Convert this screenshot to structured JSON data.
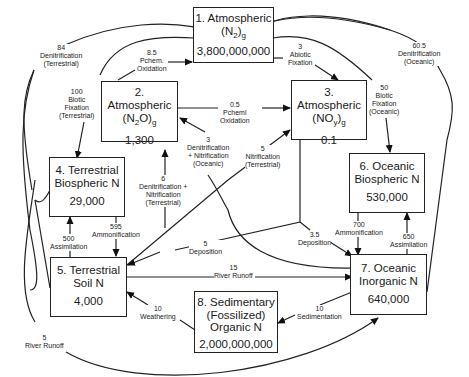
{
  "boxes": [
    {
      "id": 1,
      "line1": "1. Atmospheric",
      "line2_pre": "(N",
      "line2_sub": "2",
      "line2_post": ")",
      "line2_sub2": "g",
      "value": "3,800,000,000"
    },
    {
      "id": 2,
      "line1": "2. Atmospheric",
      "line2_pre": "(N",
      "line2_sub": "2",
      "line2_post": "O)",
      "line2_sub2": "g",
      "value": "1,300"
    },
    {
      "id": 3,
      "line1": "3. Atmospheric",
      "line2_pre": "(NO",
      "line2_sub": "y",
      "line2_post": ")",
      "line2_sub2": "g",
      "value": "0.1"
    },
    {
      "id": 4,
      "line1": "4. Terrestrial",
      "line2": "Biospheric N",
      "value": "29,000"
    },
    {
      "id": 5,
      "line1": "5. Terrestrial",
      "line2": "Soil N",
      "value": "4,000"
    },
    {
      "id": 6,
      "line1": "6. Oceanic",
      "line2": "Biospheric N",
      "value": "530,000"
    },
    {
      "id": 7,
      "line1": "7. Oceanic",
      "line2": "Inorganic N",
      "value": "640,000"
    },
    {
      "id": 8,
      "line1": "8. Sedimentary",
      "line2": "(Fossilized)",
      "line3": "Organic N",
      "value": "2,000,000,000"
    }
  ],
  "flows": {
    "denit_terr": {
      "value": "84",
      "l1": "Denitrification",
      "l2": "(Terrestrial)"
    },
    "pchem_ox_1": {
      "value": "8.5",
      "l1": "Pchem.",
      "l2": "Oxidation"
    },
    "abiotic_fix": {
      "value": "3",
      "l1": "Abiotic",
      "l2": "Fixation"
    },
    "denit_ocean": {
      "value": "60.5",
      "l1": "Denitrification",
      "l2": "(Oceanic)"
    },
    "biotic_fix_terr": {
      "value": "100",
      "l1": "Biotic",
      "l2": "Fixation",
      "l3": "(Terrestrial)"
    },
    "pchem_ox_2": {
      "value": "0.5",
      "l1": "Pcheml",
      "l2": "Oxidation"
    },
    "biotic_fix_ocean": {
      "value": "50",
      "l1": "Biotic",
      "l2": "Fixation",
      "l3": "(Oceanic)"
    },
    "denit_nit_ocean": {
      "value": "3",
      "l1": "Denitrification",
      "l2": "+ Nitrification",
      "l3": "(Oceanic)"
    },
    "nit_terr": {
      "value": "5",
      "l1": "Nitrification",
      "l2": "(Terrestrial)"
    },
    "denit_nit_terr": {
      "value": "6",
      "l1": "Denitrification +",
      "l2": "Nitrification",
      "l3": "(Terrestrial)"
    },
    "assim_terr": {
      "value": "500",
      "l1": "Assimilation"
    },
    "ammon_terr": {
      "value": "595",
      "l1": "Ammonification"
    },
    "deposition_terr": {
      "value": "5",
      "l1": "Deposition"
    },
    "deposition_ocean": {
      "value": "3.5",
      "l1": "Deposition"
    },
    "ammon_ocean": {
      "value": "700",
      "l1": "Ammonification"
    },
    "assim_ocean": {
      "value": "650",
      "l1": "Assimilation"
    },
    "river_runoff_15": {
      "value": "15",
      "l1": "River Runoff"
    },
    "weathering": {
      "value": "10",
      "l1": "Weathering"
    },
    "sedimentation": {
      "value": "10",
      "l1": "Sedimentation"
    },
    "river_runoff_5": {
      "value": "5",
      "l1": "River Runoff"
    }
  }
}
